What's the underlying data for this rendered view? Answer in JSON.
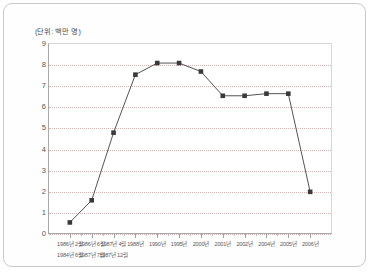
{
  "unit_note": "(단위: 백만 명)",
  "chart_data": {
    "type": "line",
    "title": "",
    "subtitle": "",
    "xlabel": "",
    "ylabel": "",
    "unit": "백만 명",
    "ylim": [
      0,
      9
    ],
    "yticks": [
      0,
      1,
      2,
      3,
      4,
      5,
      6,
      7,
      8,
      9
    ],
    "ytick_labels": [
      "0",
      "1",
      "2",
      "3",
      "4",
      "5",
      "6",
      "7",
      "8",
      "9"
    ],
    "grid": true,
    "grid_style": "dotted",
    "legend": false,
    "legend_position": "none",
    "marker": "square",
    "marker_color": "#3a3a3a",
    "line_color": "#555555",
    "categories": [
      "1986년 2월",
      "1986년 6월",
      "1987년 4월",
      "1988년",
      "1990년",
      "1995년",
      "2000년",
      "2001년",
      "2002년",
      "2004년",
      "2005년",
      "2006년"
    ],
    "categories_row2": [
      "1984년 6월",
      "1987년 7월",
      "1987년 12월"
    ],
    "values": [
      0.5,
      1.55,
      4.75,
      7.5,
      8.05,
      8.05,
      7.65,
      6.5,
      6.5,
      6.6,
      6.6,
      1.95
    ],
    "annotations": []
  }
}
